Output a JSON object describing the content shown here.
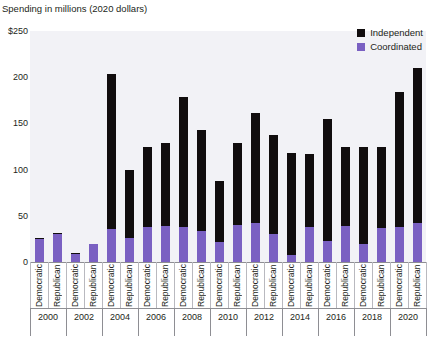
{
  "chart_data": {
    "type": "bar",
    "title": "Spending in millions (2020 dollars)",
    "xlabel": "",
    "ylabel": "Spending in millions (2020 dollars)",
    "ylim": [
      0,
      250
    ],
    "yticks": [
      0,
      50,
      100,
      150,
      200,
      250
    ],
    "ytick_labels": [
      "0",
      "50",
      "100",
      "150",
      "200",
      "$250"
    ],
    "grid": false,
    "stacked": true,
    "legend_position": "top-right",
    "legend": [
      "Independent",
      "Coordinated"
    ],
    "colors": {
      "independent": "#110d0e",
      "coordinated": "#7a60c2",
      "plot_background": "#f2f2f6",
      "axis": "#8e8e93",
      "text": "#231f20"
    },
    "years": [
      "2000",
      "2002",
      "2004",
      "2006",
      "2008",
      "2010",
      "2012",
      "2014",
      "2016",
      "2018",
      "2020"
    ],
    "parties": [
      "Democratic",
      "Republican"
    ],
    "categories": [
      "2000 Democratic",
      "2000 Republican",
      "2002 Democratic",
      "2002 Republican",
      "2004 Democratic",
      "2004 Republican",
      "2006 Democratic",
      "2006 Republican",
      "2008 Democratic",
      "2008 Republican",
      "2010 Democratic",
      "2010 Republican",
      "2012 Democratic",
      "2012 Republican",
      "2014 Democratic",
      "2014 Republican",
      "2016 Democratic",
      "2016 Republican",
      "2018 Democratic",
      "2018 Republican",
      "2020 Democratic",
      "2020 Republican"
    ],
    "series": [
      {
        "name": "Coordinated",
        "color": "#7a60c2",
        "values": [
          25,
          30,
          9,
          19,
          36,
          26,
          38,
          39,
          38,
          34,
          22,
          40,
          42,
          30,
          8,
          38,
          23,
          39,
          20,
          37,
          38,
          42
        ]
      },
      {
        "name": "Independent",
        "color": "#110d0e",
        "values": [
          1,
          1,
          1,
          1,
          167,
          74,
          86,
          90,
          141,
          109,
          66,
          89,
          119,
          107,
          110,
          79,
          132,
          86,
          105,
          87,
          146,
          168
        ]
      }
    ],
    "totals": [
      26,
      31,
      10,
      20,
      203,
      100,
      124,
      129,
      179,
      143,
      88,
      129,
      161,
      137,
      118,
      117,
      155,
      125,
      125,
      124,
      184,
      210
    ]
  }
}
